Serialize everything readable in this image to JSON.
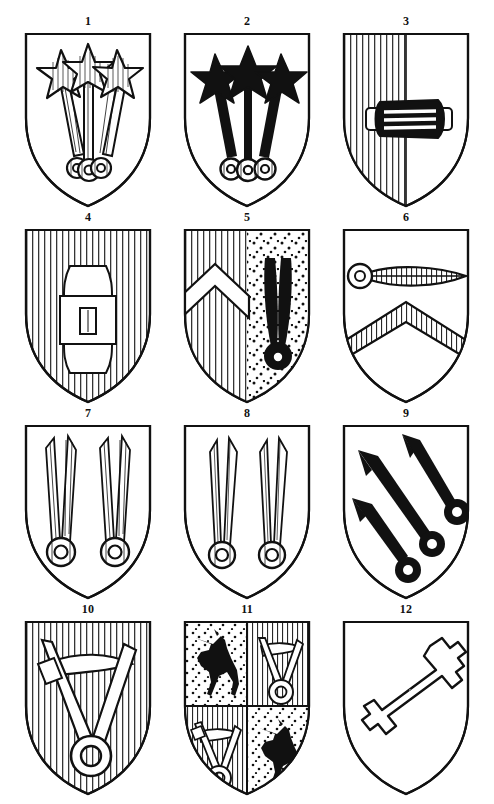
{
  "plate": {
    "title": "Heraldic shields plate",
    "columns": 3,
    "rows": 4,
    "ink_color": "#111111",
    "field_color": "#ffffff",
    "background_color": "#ffffff"
  },
  "shields": [
    {
      "number": "1",
      "label": "1",
      "field": "plain",
      "charges": "three hatched mullets on hatched staves with annulet bases",
      "charge_count": 3,
      "tincture_style": "argent-with-line-hatching",
      "charge_fill": "#ffffff"
    },
    {
      "number": "2",
      "label": "2",
      "field": "plain",
      "charges": "three sable mullets on sable staves with hatched annulet bases",
      "charge_count": 3,
      "tincture_style": "sable",
      "charge_fill": "#111111"
    },
    {
      "number": "3",
      "label": "3",
      "field": "per-pale-paly-and-plain",
      "charges": "a sable barrel fesswise",
      "charge_count": 1,
      "tincture_style": "paly-dexter",
      "charge_fill": "#111111"
    },
    {
      "number": "4",
      "label": "4",
      "field": "paly-hatched",
      "charges": "an argent barrel palewise charged with a small rectangle",
      "charge_count": 1,
      "tincture_style": "paly",
      "charge_fill": "#ffffff"
    },
    {
      "number": "5",
      "label": "5",
      "field": "per-pale-paly-and-stippled",
      "charges": "a chevron argent in dexter; a sable horn with annulet in sinister",
      "charge_count": 2,
      "tincture_style": "paly-and-semee",
      "charge_fill": "#111111"
    },
    {
      "number": "6",
      "label": "6",
      "field": "plain",
      "charges": "a hatched horn fesswise with annulet, above a hatched chevron",
      "charge_count": 2,
      "tincture_style": "hatched",
      "charge_fill": "#ffffff"
    },
    {
      "number": "7",
      "label": "7",
      "field": "plain",
      "charges": "two argent hatched horns palewise with annulet bases",
      "charge_count": 2,
      "tincture_style": "argent-with-line-hatching",
      "charge_fill": "#ffffff"
    },
    {
      "number": "8",
      "label": "8",
      "field": "plain",
      "charges": "two argent slender horns palewise with annulet bases",
      "charge_count": 2,
      "tincture_style": "argent-outline",
      "charge_fill": "#ffffff"
    },
    {
      "number": "9",
      "label": "9",
      "field": "plain",
      "charges": "three sable horns in bend with annulets",
      "charge_count": 3,
      "tincture_style": "sable",
      "charge_fill": "#111111"
    },
    {
      "number": "10",
      "label": "10",
      "field": "paly-hatched",
      "charges": "an argent compass-like instrument with arc and annulet",
      "charge_count": 1,
      "tincture_style": "paly",
      "charge_fill": "#ffffff"
    },
    {
      "number": "11",
      "label": "11",
      "field": "quarterly",
      "charges": "1 and 4 stippled with sable horse rampant; 2 and 3 paly with argent instrument",
      "charge_count": 4,
      "tincture_style": "quarterly-semee-and-paly",
      "charge_fill": "#111111",
      "quarters": [
        {
          "position": "1",
          "field": "stippled",
          "charge": "sable horse rampant"
        },
        {
          "position": "2",
          "field": "paly",
          "charge": "argent instrument with annulet"
        },
        {
          "position": "3",
          "field": "paly",
          "charge": "argent instrument with annulet"
        },
        {
          "position": "4",
          "field": "stippled",
          "charge": "sable horse rampant"
        }
      ]
    },
    {
      "number": "12",
      "label": "12",
      "field": "plain",
      "charges": "an argent key in bend",
      "charge_count": 1,
      "tincture_style": "argent-outline",
      "charge_fill": "#ffffff"
    }
  ]
}
